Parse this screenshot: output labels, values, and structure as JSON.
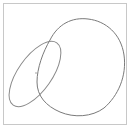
{
  "canvas": {
    "background": "#ffffff",
    "border_color": "#c8c8c8",
    "stroke_color": "#7a7a7a"
  },
  "shapes": [
    {
      "name": "large-blob",
      "type": "closed-curve"
    },
    {
      "name": "tilted-oval",
      "type": "ellipse"
    },
    {
      "name": "center-dot",
      "type": "point"
    }
  ]
}
